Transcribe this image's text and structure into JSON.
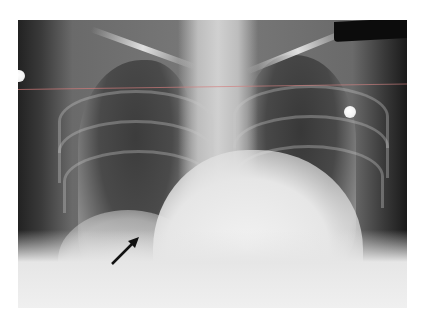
{
  "image": {
    "type": "chest-radiograph",
    "view": "PA",
    "annotation": {
      "kind": "arrow",
      "color": "#111111",
      "direction": "up-right",
      "target": "right lower lung region"
    },
    "markers": [
      "metal-dot-left",
      "metal-dot-right",
      "dark-label-top-right"
    ],
    "overlay_line_color": "#d28080"
  }
}
